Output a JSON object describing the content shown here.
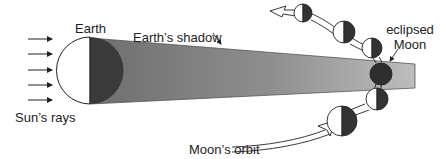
{
  "diagram": {
    "labels": {
      "earth": "Earth",
      "earth_shadow": "Earth’s shadow",
      "eclipsed_moon_line1": "eclipsed",
      "eclipsed_moon_line2": "Moon",
      "sun_rays": "Sun’s rays",
      "moon_orbit": "Moon’s orbit"
    },
    "colors": {
      "shadow_fill": "#8c8c8c",
      "shadow_tip": "#b9b9b9",
      "dark_side": "#333333",
      "lit_side": "#ffffff",
      "outline": "#222222"
    },
    "sun_rays_count": 5,
    "moon_positions": [
      {
        "phase": "half-lit",
        "position": "upper-left"
      },
      {
        "phase": "half-lit",
        "position": "upper"
      },
      {
        "phase": "half-lit",
        "position": "entering shadow"
      },
      {
        "phase": "eclipsed",
        "position": "in shadow"
      },
      {
        "phase": "half-lit",
        "position": "leaving shadow"
      },
      {
        "phase": "half-lit",
        "position": "lower"
      }
    ]
  }
}
